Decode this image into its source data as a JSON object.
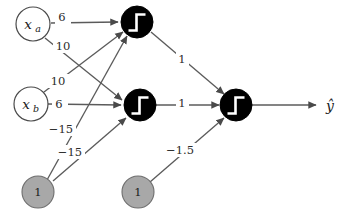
{
  "figure": {
    "title": "",
    "background_color": "#ffffff",
    "width": 345,
    "height": 213
  },
  "palette": {
    "edge": "#5b5b5b",
    "neuron_fill": "#000000",
    "neuron_glyph": "#ffffff",
    "input_fill": "#ffffff",
    "input_stroke": "#4a4a4a",
    "bias_fill": "#a8a8a8",
    "bias_stroke": "#6e6e6e",
    "text": "#1a1a1a"
  },
  "nodes": {
    "input_a": {
      "label": "x",
      "subscript": "a",
      "kind": "input"
    },
    "input_b": {
      "label": "x",
      "subscript": "b",
      "kind": "input"
    },
    "bias_hidden": {
      "label": "1",
      "kind": "bias"
    },
    "bias_output": {
      "label": "1",
      "kind": "bias"
    },
    "hidden_1": {
      "label": "",
      "kind": "neuron",
      "activation": "step"
    },
    "hidden_2": {
      "label": "",
      "kind": "neuron",
      "activation": "step"
    },
    "output": {
      "label": "",
      "kind": "neuron",
      "activation": "step"
    }
  },
  "output_signal": {
    "label": "ŷ"
  },
  "edges": [
    {
      "from": "input_a",
      "to": "hidden_1",
      "weight": "6"
    },
    {
      "from": "input_a",
      "to": "hidden_2",
      "weight": "10"
    },
    {
      "from": "input_b",
      "to": "hidden_1",
      "weight": "10"
    },
    {
      "from": "input_b",
      "to": "hidden_2",
      "weight": "6"
    },
    {
      "from": "bias_hidden",
      "to": "hidden_1",
      "weight": "−15"
    },
    {
      "from": "bias_hidden",
      "to": "hidden_2",
      "weight": "−15"
    },
    {
      "from": "hidden_1",
      "to": "output",
      "weight": "1"
    },
    {
      "from": "hidden_2",
      "to": "output",
      "weight": "1"
    },
    {
      "from": "bias_output",
      "to": "output",
      "weight": "−1.5"
    }
  ],
  "weight_labels": {
    "a_to_h1": "6",
    "a_to_h2": "10",
    "b_to_h1": "10",
    "b_to_h2": "6",
    "bias_to_h1": "−15",
    "bias_to_h2": "−15",
    "h1_to_out": "1",
    "h2_to_out": "1",
    "bias_to_out": "−1.5"
  }
}
